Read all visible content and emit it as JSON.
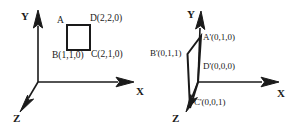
{
  "figure": {
    "title_visible": false,
    "background_color": "#ffffff",
    "stroke_color": "#1a1a1a",
    "panels": [
      {
        "name": "left-panel",
        "description": "3D coordinate axes with square ABCD in the XY plane",
        "axes": [
          {
            "name": "y-axis",
            "label": "Y",
            "label_x": 21,
            "label_y": 11
          },
          {
            "name": "x-axis",
            "label": "X",
            "label_x": 136,
            "label_y": 86
          },
          {
            "name": "z-axis",
            "label": "Z",
            "label_x": 13,
            "label_y": 113
          }
        ],
        "points": [
          {
            "name": "point-a",
            "label": "A",
            "x": 57,
            "y": 16
          },
          {
            "name": "point-d",
            "label": "D(2,2,0)",
            "x": 90,
            "y": 14
          },
          {
            "name": "point-b",
            "label": "B(1,1,0)",
            "x": 52,
            "y": 51
          },
          {
            "name": "point-c",
            "label": "C(2,1,0)",
            "x": 91,
            "y": 50
          }
        ]
      },
      {
        "name": "right-panel",
        "description": "3D coordinate axes with quadrilateral A'B'C'D'",
        "axes": [
          {
            "name": "y-axis",
            "label": "Y",
            "label_x": 187,
            "label_y": 9
          },
          {
            "name": "x-axis",
            "label": "X",
            "label_x": 277,
            "label_y": 88
          },
          {
            "name": "z-axis",
            "label": "Z",
            "label_x": 172,
            "label_y": 113
          }
        ],
        "points": [
          {
            "name": "point-a-prime",
            "label": "A'(0,1,0)",
            "x": 203,
            "y": 33
          },
          {
            "name": "point-b-prime",
            "label": "B'(0,1,1)",
            "x": 150,
            "y": 49
          },
          {
            "name": "point-d-prime",
            "label": "D'(0,0,0)",
            "x": 203,
            "y": 62
          },
          {
            "name": "point-c-prime",
            "label": "C'(0,0,1)",
            "x": 194,
            "y": 98
          }
        ]
      }
    ]
  }
}
